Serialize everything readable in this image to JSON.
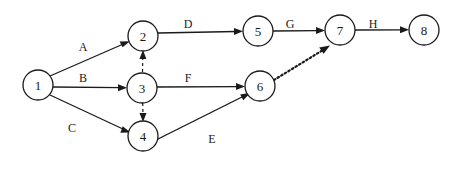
{
  "diagram": {
    "type": "activity-on-edge-network",
    "canvas": {
      "width": 458,
      "height": 169,
      "background": "#ffffff"
    },
    "stroke_color": "#1a1a1a",
    "nodes": [
      {
        "id": "1",
        "label": "1",
        "cx": 38,
        "cy": 85,
        "r": 15
      },
      {
        "id": "2",
        "label": "2",
        "cx": 143,
        "cy": 36,
        "r": 15
      },
      {
        "id": "3",
        "label": "3",
        "cx": 142,
        "cy": 88,
        "r": 15
      },
      {
        "id": "4",
        "label": "4",
        "cx": 143,
        "cy": 136,
        "r": 15
      },
      {
        "id": "5",
        "label": "5",
        "cx": 258,
        "cy": 31,
        "r": 15
      },
      {
        "id": "6",
        "label": "6",
        "cx": 260,
        "cy": 86,
        "r": 15
      },
      {
        "id": "7",
        "label": "7",
        "cx": 340,
        "cy": 30,
        "r": 15
      },
      {
        "id": "8",
        "label": "8",
        "cx": 424,
        "cy": 30,
        "r": 15
      }
    ],
    "edges": [
      {
        "id": "e-A",
        "from": "1",
        "to": "2",
        "label": "A",
        "style": "solid",
        "label_x": 83,
        "label_y": 47
      },
      {
        "id": "e-B",
        "from": "1",
        "to": "3",
        "label": "B",
        "style": "solid",
        "label_x": 83,
        "label_y": 78
      },
      {
        "id": "e-C",
        "from": "1",
        "to": "4",
        "label": "C",
        "style": "solid",
        "label_x": 72,
        "label_y": 128
      },
      {
        "id": "e-D",
        "from": "2",
        "to": "5",
        "label": "D",
        "style": "solid",
        "label_x": 188,
        "label_y": 24
      },
      {
        "id": "e-F",
        "from": "3",
        "to": "6",
        "label": "F",
        "style": "solid",
        "label_x": 188,
        "label_y": 78
      },
      {
        "id": "e-E",
        "from": "4",
        "to": "6",
        "label": "E",
        "style": "solid",
        "label_x": 212,
        "label_y": 139
      },
      {
        "id": "e-G",
        "from": "5",
        "to": "7",
        "label": "G",
        "style": "solid",
        "label_x": 290,
        "label_y": 24
      },
      {
        "id": "e-H",
        "from": "7",
        "to": "8",
        "label": "H",
        "style": "solid",
        "label_x": 373,
        "label_y": 24
      },
      {
        "id": "e-dummy-3-2",
        "from": "3",
        "to": "2",
        "label": "",
        "style": "dashed",
        "label_x": null,
        "label_y": null
      },
      {
        "id": "e-dummy-3-4",
        "from": "3",
        "to": "4",
        "label": "",
        "style": "dashed",
        "label_x": null,
        "label_y": null
      },
      {
        "id": "e-dummy-6-7",
        "from": "6",
        "to": "7",
        "label": "",
        "style": "dotted",
        "label_x": null,
        "label_y": null
      }
    ]
  }
}
